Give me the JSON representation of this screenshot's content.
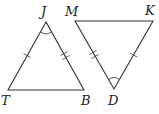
{
  "diagram": {
    "type": "two isosceles triangles with congruence markings",
    "triangles": [
      {
        "name": "triangle-JTB",
        "vertices": [
          {
            "label": "J",
            "x": 46,
            "y": 22,
            "label_x": 41,
            "label_y": 17
          },
          {
            "label": "T",
            "x": 8,
            "y": 90,
            "label_x": 1,
            "label_y": 105
          },
          {
            "label": "B",
            "x": 84,
            "y": 90,
            "label_x": 82,
            "label_y": 105
          }
        ],
        "angle_mark_at": "J",
        "tick_marks": [
          {
            "side": "JT",
            "count": 1
          },
          {
            "side": "JB",
            "count": 2
          }
        ]
      },
      {
        "name": "triangle-MKD",
        "vertices": [
          {
            "label": "M",
            "x": 75,
            "y": 21,
            "label_x": 66,
            "label_y": 17
          },
          {
            "label": "K",
            "x": 153,
            "y": 21,
            "label_x": 145,
            "label_y": 15
          },
          {
            "label": "D",
            "x": 114,
            "y": 89,
            "label_x": 108,
            "label_y": 105
          }
        ],
        "angle_mark_at": "D",
        "tick_marks": [
          {
            "side": "MD",
            "count": 2
          },
          {
            "side": "KD",
            "count": 1
          }
        ]
      }
    ],
    "labels": {
      "J": "J",
      "T": "T",
      "B": "B",
      "M": "M",
      "K": "K",
      "D": "D"
    },
    "colors": {
      "stroke": "#333333",
      "label": "#222222",
      "background": "#ffffff"
    }
  }
}
